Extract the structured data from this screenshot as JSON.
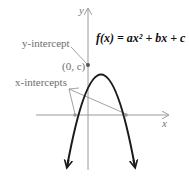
{
  "diagram": {
    "type": "parabola-graph",
    "formula": "f(x) = ax² + bx + c",
    "axes": {
      "x_label": "x",
      "y_label": "y"
    },
    "annotations": {
      "y_intercept_label": "y-intercept",
      "y_intercept_point": "(0, c)",
      "x_intercepts_label": "x-intercepts"
    },
    "colors": {
      "curve": "#1a1a1a",
      "axes": "#9a9a9a",
      "labels": "#6e6e6e",
      "leader_lines": "#8a8a8a"
    }
  }
}
